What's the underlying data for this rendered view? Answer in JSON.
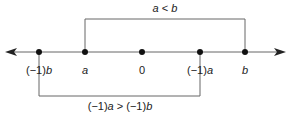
{
  "diagram": {
    "axis": {
      "y": 52,
      "x_start": 6,
      "x_end": 286,
      "color": "#555555",
      "arrows": "both"
    },
    "points": [
      {
        "id": "neg-b",
        "x": 39,
        "label_prefix": "(−1)",
        "label_var": "b"
      },
      {
        "id": "a",
        "x": 85,
        "label_prefix": "",
        "label_var": "a"
      },
      {
        "id": "zero",
        "x": 142,
        "label_prefix": "",
        "label_var": "0"
      },
      {
        "id": "neg-a",
        "x": 200,
        "label_prefix": "(−1)",
        "label_var": "a"
      },
      {
        "id": "b",
        "x": 245,
        "label_prefix": "",
        "label_var": "b"
      }
    ],
    "top_bracket": {
      "from": "a",
      "to": "b",
      "y": 19,
      "label": {
        "p1": "a",
        "op": " < ",
        "p2": "b"
      }
    },
    "bottom_bracket": {
      "from": "neg-b",
      "to": "neg-a",
      "y": 96,
      "label": {
        "p1pre": "(−1)",
        "p1": "a",
        "op": " > ",
        "p2pre": "(−1)",
        "p2": "b"
      }
    }
  }
}
